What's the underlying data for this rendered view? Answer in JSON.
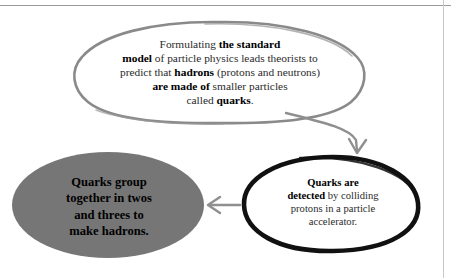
{
  "diagram": {
    "background_color": "#ffffff",
    "colors": {
      "gray_oval_fill": "#767676",
      "gray_outline": "#8a8a8a",
      "black_outline": "#111111",
      "arrow_gray": "#8f8f8f",
      "body_text": "#2b2b2b",
      "rule_gray": "#9b9b9b"
    },
    "nodes": [
      {
        "id": "standard-model",
        "shape": "oval",
        "style": "hand-drawn gray outline, white fill",
        "lines": [
          [
            {
              "text": "Formulating ",
              "bold": false
            },
            {
              "text": "the standard",
              "bold": true
            }
          ],
          [
            {
              "text": "model",
              "bold": true
            },
            {
              "text": " of particle physics leads theorists to",
              "bold": false
            }
          ],
          [
            {
              "text": "predict that ",
              "bold": false
            },
            {
              "text": "hadrons",
              "bold": true
            },
            {
              "text": " (protons and neutrons)",
              "bold": false
            }
          ],
          [
            {
              "text": "are made of",
              "bold": true
            },
            {
              "text": " smaller particles",
              "bold": false
            }
          ],
          [
            {
              "text": "called ",
              "bold": false
            },
            {
              "text": "quarks",
              "bold": true
            },
            {
              "text": ".",
              "bold": false
            }
          ]
        ],
        "plain_text": "Formulating the standard model of particle physics leads theorists to predict that hadrons (protons and neutrons) are made of smaller particles called quarks."
      },
      {
        "id": "detected",
        "shape": "oval",
        "style": "hand-drawn thick black outline, white fill",
        "lines": [
          [
            {
              "text": "Quarks are",
              "bold": true
            }
          ],
          [
            {
              "text": "detected",
              "bold": true
            },
            {
              "text": " by colliding",
              "bold": false
            }
          ],
          [
            {
              "text": "protons in a particle",
              "bold": false
            }
          ],
          [
            {
              "text": "accelerator.",
              "bold": false
            }
          ]
        ],
        "plain_text": "Quarks are detected by colliding protons in a particle accelerator."
      },
      {
        "id": "group",
        "shape": "oval",
        "style": "solid gray filled oval, bold black text",
        "lines": [
          [
            {
              "text": "Quarks group",
              "bold": true
            }
          ],
          [
            {
              "text": "together in twos",
              "bold": true
            }
          ],
          [
            {
              "text": "and threes to",
              "bold": true
            }
          ],
          [
            {
              "text": "make hadrons.",
              "bold": true
            }
          ]
        ],
        "plain_text": "Quarks group together in twos and threes to make hadrons."
      }
    ],
    "arrows": [
      {
        "id": "arrow-standard-model-to-detected",
        "from": "standard-model",
        "to": "detected",
        "direction": "curved down-right",
        "color": "#8f8f8f"
      },
      {
        "id": "arrow-detected-to-group",
        "from": "detected",
        "to": "group",
        "direction": "left",
        "color": "#8f8f8f"
      }
    ]
  }
}
